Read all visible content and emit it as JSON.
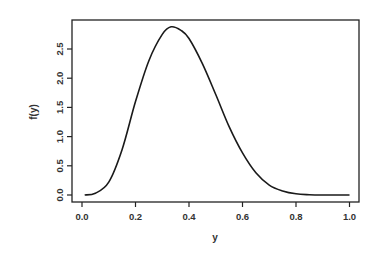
{
  "chart_data": {
    "type": "line",
    "title": "",
    "xlabel": "y",
    "ylabel": "f(y)",
    "xlim": [
      0.0,
      1.0
    ],
    "ylim": [
      0.0,
      2.5
    ],
    "x_ticks": [
      "0.0",
      "0.2",
      "0.4",
      "0.6",
      "0.8",
      "1.0"
    ],
    "y_ticks": [
      "0.0",
      "0.5",
      "1.0",
      "1.5",
      "2.0",
      "2.5"
    ],
    "grid": false,
    "legend": "none",
    "series": [
      {
        "name": "f(y)",
        "x": [
          0.01,
          0.05,
          0.1,
          0.15,
          0.2,
          0.25,
          0.3,
          0.333,
          0.37,
          0.4,
          0.45,
          0.5,
          0.55,
          0.6,
          0.65,
          0.7,
          0.75,
          0.8,
          0.85,
          0.9,
          0.95,
          1.0
        ],
        "y": [
          0.0,
          0.03,
          0.22,
          0.78,
          1.6,
          2.3,
          2.75,
          2.88,
          2.82,
          2.68,
          2.25,
          1.72,
          1.17,
          0.72,
          0.38,
          0.17,
          0.07,
          0.02,
          0.005,
          0.0,
          0.0,
          0.0
        ]
      }
    ]
  }
}
